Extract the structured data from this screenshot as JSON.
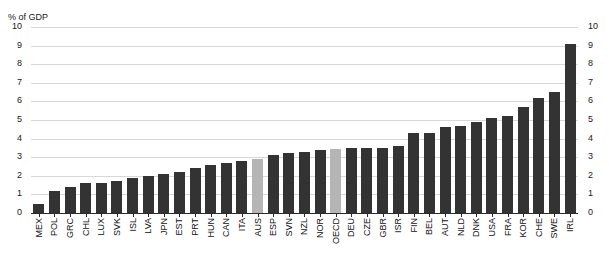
{
  "chart_data": {
    "type": "bar",
    "title": "",
    "subtitle": "",
    "xlabel": "",
    "ylabel": "% of GDP",
    "ylim": [
      0,
      10
    ],
    "grid": true,
    "legend": "none",
    "y_ticks": [
      10,
      9,
      8,
      7,
      6,
      5,
      4,
      3,
      2,
      1,
      0
    ],
    "right_axis_ticks": [
      10,
      9,
      8,
      7,
      6,
      5,
      4,
      3,
      2,
      1,
      0
    ],
    "highlight_color": "#b5b5b5",
    "bar_color": "#333333",
    "highlighted_categories": [
      "AUS",
      "OECD"
    ],
    "categories": [
      "MEX",
      "POL",
      "GRC",
      "CHL",
      "LUX",
      "SVK",
      "ISL",
      "LVA",
      "JPN",
      "EST",
      "PRT",
      "HUN",
      "CAN",
      "ITA",
      "AUS",
      "ESP",
      "SVN",
      "NZL",
      "NOR",
      "OECD",
      "DEU",
      "CZE",
      "GBR",
      "ISR",
      "FIN",
      "BEL",
      "AUT",
      "NLD",
      "DNK",
      "USA",
      "FRA",
      "KOR",
      "CHE",
      "SWE",
      "IRL"
    ],
    "values": [
      0.5,
      1.2,
      1.4,
      1.6,
      1.6,
      1.7,
      1.9,
      2.0,
      2.1,
      2.2,
      2.4,
      2.6,
      2.7,
      2.8,
      2.9,
      3.1,
      3.2,
      3.3,
      3.4,
      3.45,
      3.5,
      3.5,
      3.5,
      3.6,
      4.3,
      4.3,
      4.6,
      4.7,
      4.9,
      5.1,
      5.2,
      5.7,
      6.2,
      6.5,
      9.1
    ]
  }
}
